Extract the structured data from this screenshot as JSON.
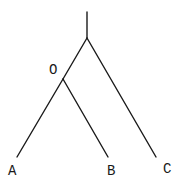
{
  "diagram": {
    "type": "phylogenetic-tree",
    "nodes": {
      "root_top": {
        "x": 87,
        "y": 12
      },
      "root": {
        "x": 87,
        "y": 38
      },
      "O": {
        "x": 63,
        "y": 79,
        "label": "O"
      },
      "A": {
        "x": 17,
        "y": 157,
        "label": "A"
      },
      "B": {
        "x": 108,
        "y": 157,
        "label": "B"
      },
      "C": {
        "x": 156,
        "y": 157,
        "label": "C"
      }
    },
    "labels": {
      "O": "O",
      "A": "A",
      "B": "B",
      "C": "C"
    },
    "edges": [
      {
        "from": "root_top",
        "to": "root"
      },
      {
        "from": "root",
        "to": "O"
      },
      {
        "from": "O",
        "to": "A"
      },
      {
        "from": "O",
        "to": "B"
      },
      {
        "from": "root",
        "to": "C"
      }
    ],
    "colors": {
      "line": "#1a1a1a",
      "background": "#ffffff"
    }
  }
}
